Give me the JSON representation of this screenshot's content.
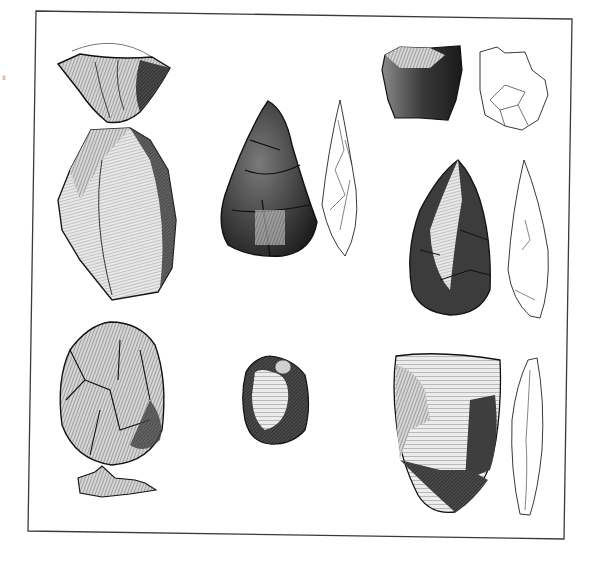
{
  "plate": {
    "description": "Engraved plate of Paleolithic flint stone tools (hand axes and scrapers) with outline side-profile drawings",
    "background": "#ffffff",
    "frame_color": "#3a3a3a",
    "margin_mark": "8",
    "artifacts": [
      {
        "id": "fig-top-left-cap",
        "kind": "shaded",
        "label": "wedge-shaped flint (top view)"
      },
      {
        "id": "fig-left-large",
        "kind": "shaded",
        "label": "large flat flint flake"
      },
      {
        "id": "fig-center-handaxe",
        "kind": "shaded",
        "label": "pointed hand axe"
      },
      {
        "id": "fig-center-handaxe-profile",
        "kind": "outline",
        "label": "hand axe side profile"
      },
      {
        "id": "fig-top-right-block",
        "kind": "shaded",
        "label": "flint core block"
      },
      {
        "id": "fig-top-right-block-outline",
        "kind": "outline",
        "label": "core block outline"
      },
      {
        "id": "fig-right-handaxe",
        "kind": "shaded",
        "label": "hand axe"
      },
      {
        "id": "fig-right-handaxe-profile",
        "kind": "outline",
        "label": "hand axe side profile"
      },
      {
        "id": "fig-bottom-left-oval",
        "kind": "shaded",
        "label": "ovate hand axe"
      },
      {
        "id": "fig-bottom-left-fragment",
        "kind": "shaded",
        "label": "flint fragment"
      },
      {
        "id": "fig-bottom-center-scraper",
        "kind": "shaded",
        "label": "small scraper"
      },
      {
        "id": "fig-bottom-right-cleaver",
        "kind": "shaded",
        "label": "cleaver / scraper"
      },
      {
        "id": "fig-bottom-right-cleaver-profile",
        "kind": "outline",
        "label": "cleaver side profile"
      }
    ]
  }
}
